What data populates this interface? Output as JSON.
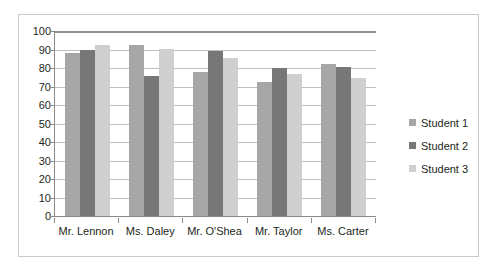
{
  "chart_data": {
    "type": "bar",
    "title": "",
    "subtitle": "",
    "xlabel": "",
    "ylabel": "",
    "ylim": [
      0,
      100
    ],
    "ytick_step": 10,
    "yticks": [
      100,
      90,
      80,
      70,
      60,
      50,
      40,
      30,
      20,
      10,
      0
    ],
    "grid": true,
    "grid_axis": "y",
    "legend_position": "right",
    "categories": [
      "Mr. Lennon",
      "Ms. Daley",
      "Mr. O'Shea",
      "Mr. Taylor",
      "Ms. Carter"
    ],
    "series": [
      {
        "name": "Student 1",
        "color": "#a6a6a6",
        "values": [
          88,
          92.5,
          78,
          72.5,
          82
        ]
      },
      {
        "name": "Student 2",
        "color": "#777777",
        "values": [
          90,
          75.5,
          89,
          80,
          80.5
        ]
      },
      {
        "name": "Student 3",
        "color": "#cfcfcf",
        "values": [
          92.5,
          90.5,
          85.5,
          77,
          74.5
        ]
      }
    ]
  },
  "legend": {
    "items": [
      {
        "label": "Student 1"
      },
      {
        "label": "Student 2"
      },
      {
        "label": "Student 3"
      }
    ]
  },
  "colors": {
    "series_1": "#a6a6a6",
    "series_2": "#777777",
    "series_3": "#cfcfcf",
    "axis": "#8a8a8a",
    "gridline": "#bfbfbf",
    "frame_border": "#c9c9c9",
    "text": "#231f20",
    "background": "#ffffff"
  }
}
